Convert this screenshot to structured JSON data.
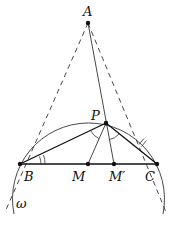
{
  "diagram": {
    "type": "geometry",
    "points": {
      "A": {
        "label": "A",
        "x": 88,
        "y": 23
      },
      "P": {
        "label": "P",
        "x": 106,
        "y": 123
      },
      "B": {
        "label": "B",
        "x": 20,
        "y": 164
      },
      "C": {
        "label": "C",
        "x": 157,
        "y": 164
      },
      "M": {
        "label": "M",
        "x": 88,
        "y": 164
      },
      "Mp": {
        "label": "M′",
        "x": 114,
        "y": 164
      }
    },
    "circle": {
      "label": "ω",
      "cx": 88.5,
      "cy": 197,
      "r": 76
    },
    "segments": [
      {
        "from": "B",
        "to": "C",
        "style": "solid"
      },
      {
        "from": "B",
        "to": "P",
        "style": "solid"
      },
      {
        "from": "P",
        "to": "C",
        "style": "solid"
      },
      {
        "from": "A",
        "to": "M'",
        "style": "solid"
      },
      {
        "from": "P",
        "to": "M",
        "style": "solid"
      },
      {
        "from": "A",
        "to": "B",
        "style": "dashed"
      },
      {
        "from": "A",
        "to": "C",
        "style": "dashed"
      }
    ],
    "angle_marks": [
      "double arc at B",
      "arc at P (BPM)",
      "arc at P (M'PC)",
      "double tick on PC"
    ],
    "colors": {
      "stroke": "#222222",
      "background": "#ffffff"
    }
  }
}
